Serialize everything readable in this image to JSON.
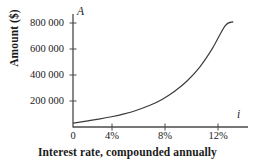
{
  "chart_data": {
    "type": "line",
    "title": "",
    "subtitle": "",
    "xlabel": "Interest rate, compounded annually",
    "ylabel": "Amount ($)",
    "x_axis_variable": "i",
    "y_axis_variable": "A",
    "xtick_labels": [
      "0",
      "4%",
      "8%",
      "12%"
    ],
    "xtick_values": [
      0,
      4,
      8,
      12
    ],
    "ytick_labels": [
      "200 000",
      "400 000",
      "600 000",
      "800 000"
    ],
    "ytick_values": [
      200000,
      400000,
      600000,
      800000
    ],
    "xlim": [
      0,
      13.8
    ],
    "ylim": [
      0,
      860000
    ],
    "grid": false,
    "legend": false,
    "series": [
      {
        "name": "Compound amount",
        "x": [
          0,
          1,
          2,
          3,
          4,
          5,
          6,
          7,
          8,
          9,
          10,
          11,
          12,
          12.6
        ],
        "y": [
          30000,
          45000,
          60000,
          78000,
          100000,
          128000,
          163000,
          210000,
          272000,
          352000,
          458000,
          600000,
          772000,
          800000
        ]
      }
    ],
    "curve_color": "#3a3a3a",
    "axis_color": "#4a4a4a",
    "background_color": "#ffffff"
  }
}
